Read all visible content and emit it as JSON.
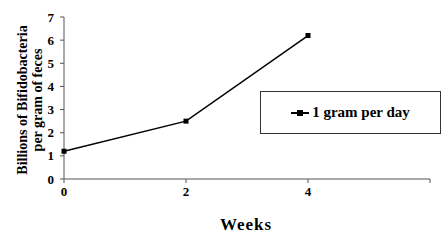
{
  "chart_data": {
    "type": "line",
    "title": "",
    "xlabel": "Weeks",
    "ylabel": "Billions of Bifidobacteria per gram of feces",
    "ylabel_lines": [
      "Billions of Bifidobacteria",
      "per gram of feces"
    ],
    "x": [
      0,
      2,
      4
    ],
    "x_ticks": [
      "0",
      "2",
      "4"
    ],
    "y_ticks": [
      "0",
      "1",
      "2",
      "3",
      "4",
      "5",
      "6",
      "7"
    ],
    "ylim": [
      0,
      7
    ],
    "xlim": [
      0,
      6
    ],
    "grid": false,
    "legend_position": "right",
    "series": [
      {
        "name": "1 gram per day",
        "values": [
          1.2,
          2.5,
          6.2
        ],
        "color": "#000000",
        "marker": "square"
      }
    ]
  },
  "legend": {
    "label": "1 gram per day"
  }
}
